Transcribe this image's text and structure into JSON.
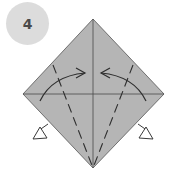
{
  "step": {
    "number": "4"
  },
  "colors": {
    "badge_fill": "#dcdcdc",
    "badge_text": "#4a4a4a",
    "paper_fill": "#b5b5b5",
    "line": "#3c3c3c",
    "background": "#ffffff"
  },
  "diagram": {
    "shape": "square-on-point",
    "vertices": {
      "top": [
        93,
        19
      ],
      "left": [
        23,
        94
      ],
      "right": [
        164,
        94
      ],
      "bottom": [
        93,
        168
      ]
    },
    "creases": [
      "vertical-center",
      "horizontal-center"
    ],
    "fold_lines": [
      "dashed-left-to-bottom",
      "dashed-right-to-bottom"
    ],
    "arrows": [
      "curved-left-to-center",
      "curved-right-to-center",
      "hollow-push-left",
      "hollow-push-right"
    ]
  },
  "caption": {
    "text": ""
  }
}
